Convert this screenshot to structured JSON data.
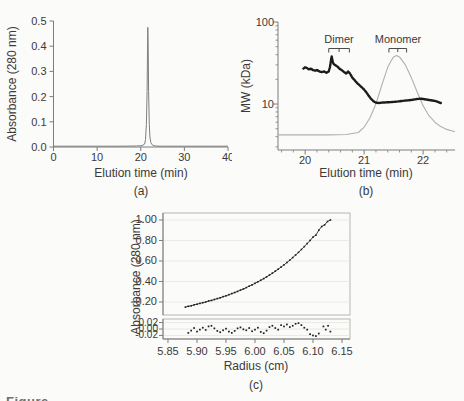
{
  "figure": {
    "background": "#fbfbf9",
    "text_color": "#3a3a3a",
    "axis_color": "#7d7d7d",
    "frame_color": "#b5b5b2",
    "grid_color": "#e4e4e1",
    "bottom_caption_fragment": "Figure"
  },
  "chart_data": [
    {
      "id": "a",
      "type": "line",
      "panel_label": "(a)",
      "xlabel": "Elution time (min)",
      "ylabel": "Absorbance (280 nm)",
      "xlim": [
        0,
        40
      ],
      "ylim": [
        0,
        0.5
      ],
      "grid": false,
      "xticks": {
        "values": [
          0,
          10,
          20,
          30,
          40
        ],
        "labels": [
          "0",
          "10",
          "20",
          "30",
          "40"
        ]
      },
      "yticks": {
        "values": [
          0.0,
          0.1,
          0.2,
          0.3,
          0.4,
          0.5
        ],
        "labels": [
          "0.0",
          "0.1",
          "0.2",
          "0.3",
          "0.4",
          "0.5"
        ]
      },
      "series": [
        {
          "name": "uv-absorbance-trace",
          "kind": "line",
          "color": "#7f7f7f",
          "width": 1,
          "points": [
            [
              0,
              0.003
            ],
            [
              5,
              0.003
            ],
            [
              10,
              0.003
            ],
            [
              15,
              0.003
            ],
            [
              19,
              0.004
            ],
            [
              20,
              0.005
            ],
            [
              20.5,
              0.007
            ],
            [
              20.9,
              0.012
            ],
            [
              21.1,
              0.03
            ],
            [
              21.3,
              0.09
            ],
            [
              21.45,
              0.22
            ],
            [
              21.55,
              0.38
            ],
            [
              21.62,
              0.475
            ],
            [
              21.7,
              0.4
            ],
            [
              21.8,
              0.22
            ],
            [
              21.95,
              0.09
            ],
            [
              22.1,
              0.04
            ],
            [
              22.3,
              0.018
            ],
            [
              22.6,
              0.009
            ],
            [
              23,
              0.005
            ],
            [
              23.5,
              0.004
            ],
            [
              24.5,
              0.003
            ],
            [
              26,
              0.003
            ],
            [
              30,
              0.003
            ],
            [
              35,
              0.003
            ],
            [
              40,
              0.003
            ]
          ]
        }
      ]
    },
    {
      "id": "b",
      "type": "line",
      "panel_label": "(b)",
      "xlabel": "Elution time (min)",
      "ylabel": "MW (kDa)",
      "yscale": "log",
      "xlim": [
        19.54,
        22.54
      ],
      "ylim": [
        2.75,
        100
      ],
      "grid": false,
      "xticks": {
        "values": [
          20,
          21,
          22
        ],
        "labels": [
          "20",
          "21",
          "22"
        ],
        "minor": [
          19.6,
          19.8,
          20.2,
          20.4,
          20.6,
          20.8,
          21.2,
          21.4,
          21.6,
          21.8,
          22.2,
          22.4
        ]
      },
      "yticks": {
        "values": [
          10,
          100
        ],
        "labels": [
          "10",
          "100"
        ],
        "minor": [
          3,
          4,
          5,
          6,
          7,
          8,
          9,
          20,
          30,
          40,
          50,
          60,
          70,
          80,
          90
        ]
      },
      "annotations": [
        {
          "label": "Dimer",
          "bracket_x": [
            20.4,
            20.75
          ]
        },
        {
          "label": "Monomer",
          "bracket_x": [
            21.42,
            21.72
          ]
        }
      ],
      "series": [
        {
          "name": "elution-profile-overlay",
          "kind": "line",
          "color": "#b0b0ae",
          "width": 1.1,
          "points": [
            [
              19.54,
              4.2
            ],
            [
              20,
              4.2
            ],
            [
              20.4,
              4.2
            ],
            [
              20.7,
              4.25
            ],
            [
              20.9,
              4.5
            ],
            [
              21,
              5.2
            ],
            [
              21.1,
              6.8
            ],
            [
              21.2,
              10
            ],
            [
              21.3,
              17
            ],
            [
              21.4,
              28
            ],
            [
              21.45,
              33
            ],
            [
              21.5,
              37.5
            ],
            [
              21.55,
              39
            ],
            [
              21.6,
              37.5
            ],
            [
              21.7,
              30
            ],
            [
              21.8,
              21
            ],
            [
              21.9,
              14
            ],
            [
              22,
              9.5
            ],
            [
              22.1,
              7.2
            ],
            [
              22.2,
              6
            ],
            [
              22.3,
              5.3
            ],
            [
              22.4,
              4.9
            ],
            [
              22.54,
              4.6
            ]
          ]
        },
        {
          "name": "mw-estimate-trace",
          "kind": "dotted-line",
          "color": "#1b1b1b",
          "width": 2.4,
          "points": [
            [
              19.97,
              27
            ],
            [
              20,
              28
            ],
            [
              20.03,
              27.5
            ],
            [
              20.06,
              26.5
            ],
            [
              20.1,
              27
            ],
            [
              20.13,
              26
            ],
            [
              20.17,
              25.5
            ],
            [
              20.2,
              26
            ],
            [
              20.24,
              25
            ],
            [
              20.28,
              24.5
            ],
            [
              20.32,
              25
            ],
            [
              20.36,
              24
            ],
            [
              20.4,
              25
            ],
            [
              20.42,
              28
            ],
            [
              20.43,
              31
            ],
            [
              20.44,
              35
            ],
            [
              20.45,
              38
            ],
            [
              20.46,
              35
            ],
            [
              20.47,
              32
            ],
            [
              20.49,
              30.5
            ],
            [
              20.52,
              29.5
            ],
            [
              20.55,
              28.5
            ],
            [
              20.58,
              27
            ],
            [
              20.62,
              26
            ],
            [
              20.66,
              24.5
            ],
            [
              20.7,
              23.5
            ],
            [
              20.73,
              25
            ],
            [
              20.76,
              23.5
            ],
            [
              20.8,
              21
            ],
            [
              20.84,
              19.5
            ],
            [
              20.88,
              18
            ],
            [
              20.92,
              17
            ],
            [
              20.96,
              16
            ],
            [
              21,
              15
            ],
            [
              21.04,
              13.8
            ],
            [
              21.08,
              12.5
            ],
            [
              21.12,
              11.5
            ],
            [
              21.16,
              10.8
            ],
            [
              21.2,
              10.4
            ],
            [
              21.25,
              10.3
            ],
            [
              21.3,
              10.4
            ],
            [
              21.4,
              10.5
            ],
            [
              21.5,
              10.6
            ],
            [
              21.6,
              10.8
            ],
            [
              21.7,
              11
            ],
            [
              21.8,
              11.2
            ],
            [
              21.9,
              11.5
            ],
            [
              21.95,
              11.6
            ],
            [
              22,
              11.5
            ],
            [
              22.1,
              11.2
            ],
            [
              22.2,
              10.9
            ],
            [
              22.3,
              10.3
            ]
          ]
        }
      ]
    },
    {
      "id": "c",
      "type": "scatter",
      "panel_label": "(c)",
      "xlabel": "Radius (cm)",
      "ylabel": "Absorbance (280 nm)",
      "xlim": [
        5.8414,
        6.1638
      ],
      "ylim_main": [
        0.073,
        1.068
      ],
      "ylim_residual": [
        -0.031,
        0.031
      ],
      "grid": true,
      "xticks": {
        "values": [
          5.85,
          5.9,
          5.95,
          6.0,
          6.05,
          6.1,
          6.15
        ],
        "labels": [
          "5.85",
          "5.90",
          "5.95",
          "6.00",
          "6.05",
          "6.10",
          "6.15"
        ]
      },
      "yticks_main": {
        "values": [
          0.2,
          0.4,
          0.6,
          0.8,
          1.0
        ],
        "labels": [
          "0.20",
          "0.40",
          "0.60",
          "0.80",
          "1.00"
        ]
      },
      "yticks_residual": {
        "values": [
          0.02,
          0.0,
          -0.02
        ],
        "labels": [
          "0.02",
          "0.00",
          "-0.02"
        ]
      },
      "series": [
        {
          "name": "absorbance-vs-radius",
          "kind": "scatter-line",
          "color": "#2b2b2b",
          "width": 0.9,
          "points": [
            [
              5.88,
              0.15
            ],
            [
              5.885,
              0.158
            ],
            [
              5.89,
              0.163
            ],
            [
              5.895,
              0.172
            ],
            [
              5.9,
              0.178
            ],
            [
              5.905,
              0.186
            ],
            [
              5.91,
              0.193
            ],
            [
              5.915,
              0.2
            ],
            [
              5.92,
              0.21
            ],
            [
              5.925,
              0.215
            ],
            [
              5.93,
              0.224
            ],
            [
              5.935,
              0.233
            ],
            [
              5.94,
              0.241
            ],
            [
              5.945,
              0.252
            ],
            [
              5.95,
              0.26
            ],
            [
              5.955,
              0.271
            ],
            [
              5.96,
              0.282
            ],
            [
              5.965,
              0.292
            ],
            [
              5.97,
              0.303
            ],
            [
              5.975,
              0.316
            ],
            [
              5.98,
              0.327
            ],
            [
              5.985,
              0.34
            ],
            [
              5.99,
              0.354
            ],
            [
              5.995,
              0.367
            ],
            [
              6,
              0.382
            ],
            [
              6.005,
              0.397
            ],
            [
              6.01,
              0.412
            ],
            [
              6.015,
              0.428
            ],
            [
              6.02,
              0.445
            ],
            [
              6.025,
              0.463
            ],
            [
              6.03,
              0.481
            ],
            [
              6.035,
              0.5
            ],
            [
              6.04,
              0.52
            ],
            [
              6.045,
              0.541
            ],
            [
              6.05,
              0.562
            ],
            [
              6.055,
              0.585
            ],
            [
              6.06,
              0.608
            ],
            [
              6.065,
              0.633
            ],
            [
              6.07,
              0.658
            ],
            [
              6.075,
              0.684
            ],
            [
              6.08,
              0.712
            ],
            [
              6.085,
              0.74
            ],
            [
              6.09,
              0.77
            ],
            [
              6.095,
              0.8
            ],
            [
              6.1,
              0.833
            ],
            [
              6.105,
              0.852
            ],
            [
              6.11,
              0.9
            ],
            [
              6.115,
              0.936
            ],
            [
              6.12,
              0.952
            ],
            [
              6.125,
              0.985
            ],
            [
              6.13,
              1.0
            ]
          ]
        },
        {
          "name": "fit-residuals",
          "kind": "scatter",
          "color": "#2b2b2b",
          "points": [
            [
              5.885,
              -0.012
            ],
            [
              5.89,
              -0.005
            ],
            [
              5.895,
              0.003
            ],
            [
              5.9,
              -0.008
            ],
            [
              5.905,
              -0.002
            ],
            [
              5.91,
              0.004
            ],
            [
              5.915,
              -0.003
            ],
            [
              5.92,
              0.008
            ],
            [
              5.925,
              0.01
            ],
            [
              5.93,
              0.002
            ],
            [
              5.935,
              -0.006
            ],
            [
              5.94,
              -0.01
            ],
            [
              5.945,
              -0.004
            ],
            [
              5.95,
              0.001
            ],
            [
              5.955,
              -0.008
            ],
            [
              5.96,
              -0.012
            ],
            [
              5.965,
              -0.006
            ],
            [
              5.97,
              0.002
            ],
            [
              5.975,
              0.005
            ],
            [
              5.98,
              -0.001
            ],
            [
              5.985,
              -0.004
            ],
            [
              5.99,
              0.003
            ],
            [
              5.995,
              -0.007
            ],
            [
              6,
              -0.002
            ],
            [
              6.005,
              0.004
            ],
            [
              6.01,
              -0.009
            ],
            [
              6.015,
              -0.013
            ],
            [
              6.02,
              -0.005
            ],
            [
              6.025,
              0.006
            ],
            [
              6.03,
              0.01
            ],
            [
              6.035,
              0.003
            ],
            [
              6.04,
              -0.002
            ],
            [
              6.045,
              0.012
            ],
            [
              6.05,
              0.008
            ],
            [
              6.055,
              0.014
            ],
            [
              6.06,
              0.006
            ],
            [
              6.065,
              0.01
            ],
            [
              6.07,
              0.016
            ],
            [
              6.075,
              0.018
            ],
            [
              6.08,
              0.012
            ],
            [
              6.085,
              0.004
            ],
            [
              6.09,
              -0.002
            ],
            [
              6.095,
              -0.016
            ],
            [
              6.1,
              -0.02
            ],
            [
              6.105,
              -0.022
            ],
            [
              6.11,
              -0.014
            ],
            [
              6.118,
              0.008
            ],
            [
              6.122,
              -0.002
            ],
            [
              6.126,
              0.01
            ],
            [
              6.13,
              -0.008
            ]
          ]
        }
      ]
    }
  ]
}
